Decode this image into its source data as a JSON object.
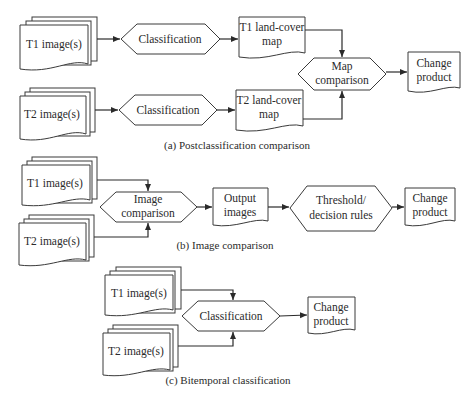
{
  "sections": {
    "a": {
      "caption": "(a) Postclassification comparison",
      "t1_images": "T1 image(s)",
      "t2_images": "T2 image(s)",
      "classification_1": "Classification",
      "classification_2": "Classification",
      "t1_map_line1": "T1 land-cover",
      "t1_map_line2": "map",
      "t2_map_line1": "T2 land-cover",
      "t2_map_line2": "map",
      "map_comparison_line1": "Map",
      "map_comparison_line2": "comparison",
      "change_line1": "Change",
      "change_line2": "product"
    },
    "b": {
      "caption": "(b) Image comparison",
      "t1_images": "T1 image(s)",
      "t2_images": "T2 image(s)",
      "image_comparison_line1": "Image",
      "image_comparison_line2": "comparison",
      "output_line1": "Output",
      "output_line2": "images",
      "threshold_line1": "Threshold/",
      "threshold_line2": "decision rules",
      "change_line1": "Change",
      "change_line2": "product"
    },
    "c": {
      "caption": "(c) Bitemporal classification",
      "t1_images": "T1 image(s)",
      "t2_images": "T2 image(s)",
      "classification": "Classification",
      "change_line1": "Change",
      "change_line2": "product"
    }
  },
  "colors": {
    "stroke": "#3a3a3a",
    "text": "#2b2b2b",
    "background": "#ffffff"
  }
}
